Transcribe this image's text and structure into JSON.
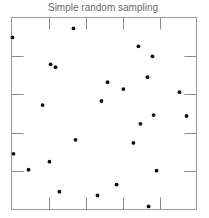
{
  "chart_data": {
    "type": "scatter",
    "title": "Simple random  sampling",
    "xlabel": "",
    "ylabel": "",
    "xlim": [
      0,
      1
    ],
    "ylim": [
      0,
      1
    ],
    "grid": false,
    "ticks": {
      "x": [
        0.2,
        0.4,
        0.6,
        0.8
      ],
      "y": [
        0.2,
        0.4,
        0.6,
        0.8
      ],
      "tick_labels": false,
      "style": "inward ticks on all four sides"
    },
    "series": [
      {
        "name": "sample",
        "marker": "dot",
        "color": "#111111",
        "points": [
          {
            "x": 0.005,
            "y": 0.896
          },
          {
            "x": 0.335,
            "y": 0.943
          },
          {
            "x": 0.211,
            "y": 0.756
          },
          {
            "x": 0.238,
            "y": 0.741
          },
          {
            "x": 0.686,
            "y": 0.85
          },
          {
            "x": 0.762,
            "y": 0.798
          },
          {
            "x": 0.735,
            "y": 0.689
          },
          {
            "x": 0.519,
            "y": 0.663
          },
          {
            "x": 0.605,
            "y": 0.627
          },
          {
            "x": 0.486,
            "y": 0.565
          },
          {
            "x": 0.908,
            "y": 0.611
          },
          {
            "x": 0.168,
            "y": 0.544
          },
          {
            "x": 0.768,
            "y": 0.492
          },
          {
            "x": 0.946,
            "y": 0.487
          },
          {
            "x": 0.697,
            "y": 0.446
          },
          {
            "x": 0.346,
            "y": 0.363
          },
          {
            "x": 0.659,
            "y": 0.347
          },
          {
            "x": 0.011,
            "y": 0.29
          },
          {
            "x": 0.205,
            "y": 0.249
          },
          {
            "x": 0.092,
            "y": 0.207
          },
          {
            "x": 0.784,
            "y": 0.202
          },
          {
            "x": 0.568,
            "y": 0.13
          },
          {
            "x": 0.259,
            "y": 0.093
          },
          {
            "x": 0.465,
            "y": 0.073
          },
          {
            "x": 0.741,
            "y": 0.016
          }
        ]
      }
    ]
  }
}
